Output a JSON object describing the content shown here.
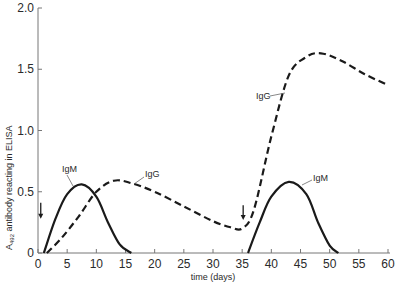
{
  "chart_data": {
    "type": "line",
    "title": "",
    "xlabel": "time  (days)",
    "ylabel": "A492 antibody reacting in ELISA",
    "ylabel_main": "A",
    "ylabel_sub": "492",
    "ylabel_rest": " antibody reacting in ELISA",
    "xlim": [
      0,
      60
    ],
    "ylim": [
      0,
      2.0
    ],
    "grid": false,
    "legend": "none (inline annotations)",
    "x_ticks": [
      0,
      5,
      10,
      15,
      20,
      25,
      30,
      35,
      40,
      45,
      50,
      55,
      60
    ],
    "y_ticks": [
      0,
      0.5,
      1.0,
      1.5,
      2.0
    ],
    "y_tick_labels": [
      "0",
      "0.5",
      "1.0",
      "1.5",
      "2.0"
    ],
    "series": [
      {
        "name": "IgM (primary)",
        "style": "solid",
        "x": [
          1,
          3,
          5,
          7.5,
          10,
          12,
          14,
          16
        ],
        "y": [
          0,
          0.28,
          0.48,
          0.56,
          0.46,
          0.25,
          0.07,
          0
        ]
      },
      {
        "name": "IgG",
        "style": "dashed",
        "x": [
          1.5,
          4,
          7,
          10,
          13,
          16,
          20,
          25,
          30,
          33,
          35,
          37,
          40,
          43,
          46,
          48.5,
          52,
          56,
          60
        ],
        "y": [
          0,
          0.12,
          0.3,
          0.5,
          0.59,
          0.57,
          0.5,
          0.38,
          0.26,
          0.21,
          0.2,
          0.35,
          0.95,
          1.45,
          1.6,
          1.63,
          1.57,
          1.46,
          1.37
        ]
      },
      {
        "name": "IgM (secondary)",
        "style": "solid",
        "x": [
          36,
          38,
          40,
          43,
          46,
          48,
          50,
          51.5
        ],
        "y": [
          0,
          0.25,
          0.46,
          0.58,
          0.48,
          0.25,
          0.06,
          0
        ]
      }
    ],
    "annotations": [
      {
        "text": "IgM",
        "x": 5.5,
        "y": 0.67
      },
      {
        "text": "IgG",
        "x": 18.5,
        "y": 0.63
      },
      {
        "text": "IgG",
        "x": 38,
        "y": 1.28
      },
      {
        "text": "IgM",
        "x": 48.5,
        "y": 0.6
      }
    ],
    "arrows": [
      {
        "meaning": "antigen injection",
        "x": 0.3,
        "y_from": 0.41,
        "y_to": 0.28
      },
      {
        "meaning": "antigen injection",
        "x": 35,
        "y_from": 0.39,
        "y_to": 0.27
      }
    ]
  },
  "labels": {
    "igm1": "IgM",
    "igg1": "IgG",
    "igg2": "IgG",
    "igm2": "IgM"
  }
}
